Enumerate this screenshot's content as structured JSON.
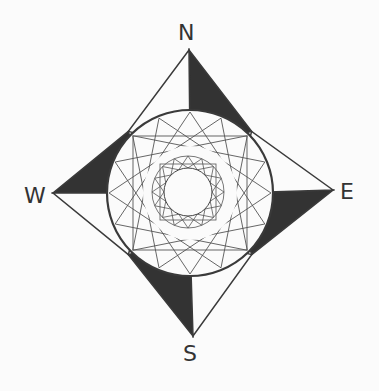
{
  "labels": {
    "north": "N",
    "east": "E",
    "south": "S",
    "west": "W"
  },
  "colors": {
    "line": "#3a3a3a",
    "fill": "#333333",
    "background": "#fbfbfb"
  },
  "geometry": {
    "center": [
      190,
      193
    ],
    "outer_circle_radius": 83,
    "inner_circle_radius": 24,
    "inner_band_radius": 36,
    "tips": {
      "north": [
        189,
        50
      ],
      "east": [
        333,
        190
      ],
      "south": [
        193,
        336
      ],
      "west": [
        53,
        193
      ]
    }
  }
}
